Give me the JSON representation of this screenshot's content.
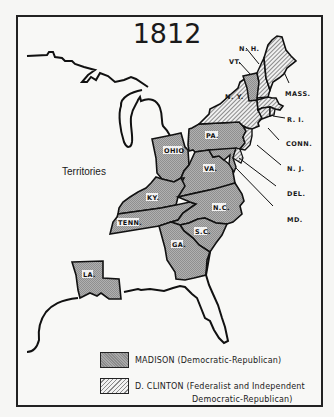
{
  "map": {
    "title": "1812",
    "region_label": "Territories",
    "colors": {
      "madison_fill": "#a9a9a9",
      "clinton_hatch": "#8a8a8a",
      "outline": "#111111",
      "background": "#f8f8f6"
    },
    "legend": [
      {
        "candidate": "MADISON (Democratic-Republican)",
        "line2": "",
        "pattern": "dotted-gray"
      },
      {
        "candidate": "D. CLINTON (Federalist and Independent",
        "line2": "Democratic-Republican)",
        "pattern": "diagonal-hatch"
      }
    ],
    "states": {
      "madison": [
        "VT.",
        "PA.",
        "OHIO",
        "VA.",
        "KY.",
        "TENN.",
        "N.C.",
        "S.C.",
        "GA.",
        "LA.",
        "MD."
      ],
      "clinton": [
        "N.H.",
        "MASS.",
        "N.Y.",
        "R.I.",
        "CONN.",
        "N.J.",
        "DEL."
      ]
    },
    "labels": {
      "nh": "N. H.",
      "vt": "VT.",
      "ny": "N. Y.",
      "mass": "MASS.",
      "ri": "R. I.",
      "conn": "CONN.",
      "nj": "N. J.",
      "del": "DEL.",
      "md": "MD.",
      "pa": "PA.",
      "ohio": "OHIO",
      "va": "VA.",
      "ky": "KY.",
      "tenn": "TENN.",
      "nc": "N.C.",
      "sc": "S.C.",
      "ga": "GA.",
      "la": "LA."
    }
  }
}
